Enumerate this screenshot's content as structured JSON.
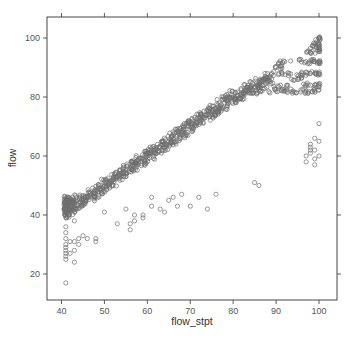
{
  "chart_data": {
    "type": "scatter",
    "title": "",
    "xlabel": "flow_stpt",
    "ylabel": "flow",
    "xlim": [
      37,
      104
    ],
    "ylim": [
      11,
      107
    ],
    "x_ticks": [
      40,
      50,
      60,
      70,
      80,
      90,
      100
    ],
    "x_tick_labels": [
      "40",
      "50",
      "60",
      "70",
      "80",
      "90",
      "100"
    ],
    "y_ticks": [
      20,
      40,
      60,
      80,
      100
    ],
    "y_tick_labels": [
      "20",
      "40",
      "60",
      "80",
      "100"
    ],
    "grid": false,
    "legend": null,
    "marker": "open-circle",
    "marker_color": "#6e6e6e",
    "series": [
      {
        "name": "main_band",
        "description": "Dense linear band roughly flow ≈ flow_stpt + 2 (±3) from x=40 to x=88",
        "x": [
          41,
          41,
          41,
          41,
          41,
          42,
          42,
          43,
          43,
          44,
          45,
          46,
          47,
          48,
          49,
          50,
          51,
          52,
          53,
          54,
          55,
          56,
          57,
          58,
          59,
          60,
          61,
          62,
          63,
          64,
          65,
          66,
          67,
          68,
          69,
          70,
          71,
          72,
          73,
          74,
          75,
          76,
          77,
          78,
          79,
          80,
          81,
          82,
          83,
          84,
          85,
          86,
          87,
          88
        ],
        "y": [
          41,
          42,
          43,
          44,
          45,
          42,
          44,
          43,
          45,
          44,
          45,
          46,
          47,
          48,
          49,
          50,
          51,
          52,
          53,
          54,
          55,
          56,
          57,
          58,
          59,
          60,
          61,
          62,
          63,
          64,
          65,
          66,
          67,
          68,
          69,
          70,
          71,
          72,
          73,
          74,
          75,
          76,
          77,
          78,
          79,
          80,
          80,
          81,
          82,
          83,
          83,
          84,
          84,
          85
        ]
      },
      {
        "name": "high_setpoint_cluster",
        "description": "Scattered/saturated region near flow_stpt 88–100 with horizontal bands at flow ≈ 80, 84, 88, 92, 95–100",
        "x": [
          88,
          89,
          90,
          90,
          91,
          92,
          92,
          93,
          94,
          95,
          96,
          97,
          97,
          98,
          98,
          98,
          99,
          99,
          99,
          100,
          100,
          100,
          100,
          100,
          100
        ],
        "y": [
          86,
          88,
          82,
          90,
          84,
          92,
          82,
          88,
          82,
          86,
          88,
          82,
          92,
          84,
          88,
          95,
          82,
          92,
          97,
          84,
          88,
          92,
          96,
          98,
          100
        ]
      },
      {
        "name": "low_outliers_left",
        "description": "Vertical cluster at flow_stpt ≈ 41 with flow 24–36, and nearby points",
        "x": [
          41,
          41,
          41,
          41,
          41,
          41,
          41,
          41,
          41,
          42,
          42,
          43,
          43,
          43,
          44,
          44,
          45,
          46,
          41
        ],
        "y": [
          25,
          26,
          27,
          28,
          29,
          30,
          32,
          34,
          36,
          31,
          27,
          24,
          28,
          31,
          30,
          32,
          33,
          32,
          17
        ]
      },
      {
        "name": "mid_outliers",
        "description": "Sparse points below the main band",
        "x": [
          43,
          48,
          48,
          50,
          53,
          55,
          56,
          56,
          57,
          57,
          59,
          59,
          61,
          61,
          63,
          64,
          65,
          66,
          67,
          68,
          70,
          72,
          74,
          76,
          85,
          86
        ],
        "y": [
          38,
          31,
          32,
          41,
          37,
          42,
          35,
          37,
          38,
          40,
          39,
          40,
          43,
          46,
          42,
          41,
          45,
          46,
          43,
          47,
          43,
          46,
          42,
          47,
          51,
          50
        ]
      },
      {
        "name": "high_outliers_right",
        "description": "Cluster at flow_stpt ≈ 97–100 with flow 55–70",
        "x": [
          97,
          97,
          98,
          98,
          98,
          98,
          99,
          99,
          99,
          99,
          100,
          100,
          100
        ],
        "y": [
          58,
          60,
          61,
          62,
          63,
          64,
          57,
          59,
          62,
          66,
          60,
          65,
          71
        ]
      }
    ]
  },
  "plot": {
    "x_axis_title": "flow_stpt",
    "y_axis_title": "flow"
  }
}
